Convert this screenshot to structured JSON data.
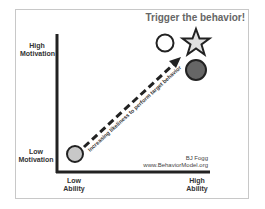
{
  "title": "Trigger the behavior!",
  "y_axis": {
    "high_line1": "High",
    "high_line2": "Motivation",
    "low_line1": "Low",
    "low_line2": "Motivation"
  },
  "x_axis": {
    "low_line1": "Low",
    "low_line2": "Ability",
    "high_line1": "High",
    "high_line2": "Ability"
  },
  "arrow_label": "Increasing likeliness to perform target behavior",
  "credit": {
    "author": "BJ Fogg",
    "site": "www.BehaviorModel.org"
  },
  "colors": {
    "axis": "#222222",
    "low_circle": "#c8c8c8",
    "high_circle": "#666666",
    "star": "#e0e0e0",
    "title": "#666666"
  }
}
